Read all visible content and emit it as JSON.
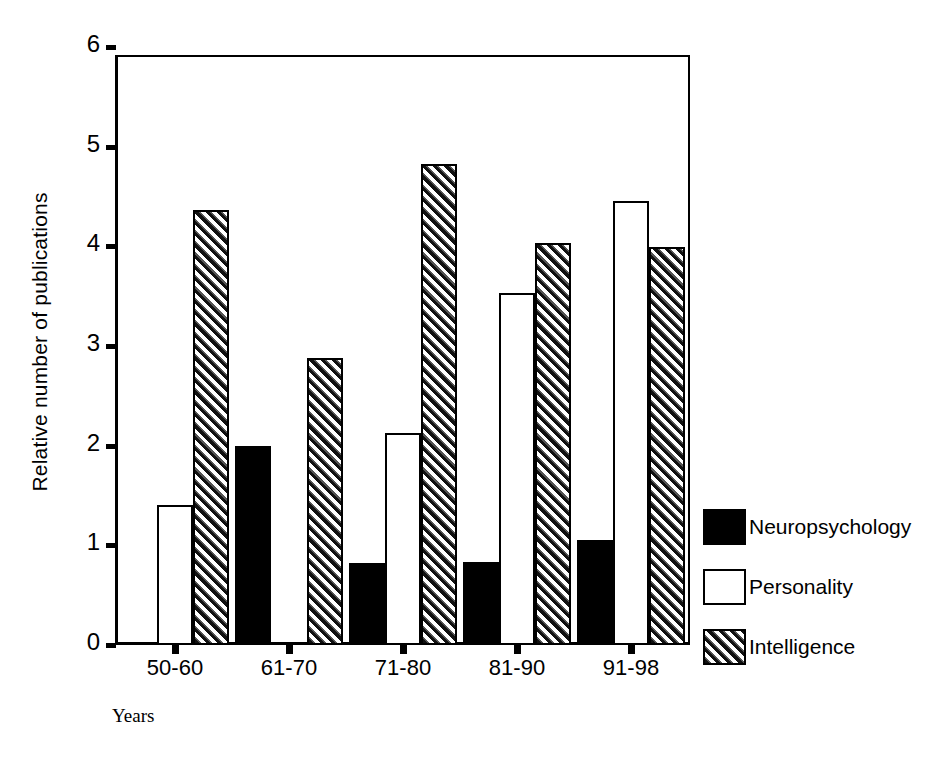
{
  "chart_data": {
    "type": "bar",
    "title": "",
    "xlabel": "Years",
    "ylabel": "Relative number of publications",
    "categories": [
      "50-60",
      "61-70",
      "71-80",
      "81-90",
      "91-98"
    ],
    "series": [
      {
        "name": "Neuropsychology",
        "values": [
          0,
          2.0,
          0.82,
          0.83,
          1.05
        ],
        "fill": "solid-black",
        "color": "#000000"
      },
      {
        "name": "Personality",
        "values": [
          1.4,
          0,
          2.13,
          3.53,
          4.45
        ],
        "fill": "white-outline",
        "color": "#ffffff"
      },
      {
        "name": "Intelligence",
        "values": [
          4.36,
          2.88,
          4.83,
          4.03,
          3.99
        ],
        "fill": "diagonal-hatch",
        "color": "#444444"
      }
    ],
    "ylim": [
      0,
      6
    ],
    "yticks": [
      0,
      1,
      2,
      3,
      4,
      5,
      6
    ],
    "ytick_labels": [
      "0",
      "1",
      "2",
      "3",
      "4",
      "5",
      "6"
    ],
    "grid": false,
    "legend_position": "right"
  },
  "legend": {
    "items": [
      {
        "label": "Neuropsychology"
      },
      {
        "label": "Personality"
      },
      {
        "label": "Intelligence"
      }
    ]
  }
}
